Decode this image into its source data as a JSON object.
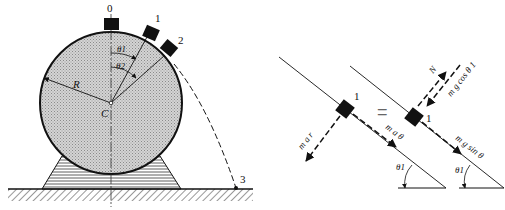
{
  "figure": {
    "left_panel": {
      "description": "Block sliding on a cylinder mounted on a stand",
      "center_label": "C",
      "radius_label": "R",
      "positions": [
        "0",
        "1",
        "2",
        "3"
      ],
      "angle_labels": [
        "θ1",
        "θ2"
      ]
    },
    "right_panel": {
      "description": "Free-body equivalence at position 1",
      "equals_sign": "=",
      "kinetic_side": {
        "block_label": "1",
        "vectors": [
          "m a r",
          "m a θ"
        ],
        "angle_label": "θ1"
      },
      "force_side": {
        "block_label": "1",
        "vectors": [
          "N",
          "m g cos θ 1",
          "m g sin θ"
        ],
        "angle_label": "θ1"
      }
    },
    "colors": {
      "ink": "#111111",
      "fill_gray": "#c8c8c8",
      "background": "#ffffff"
    }
  }
}
